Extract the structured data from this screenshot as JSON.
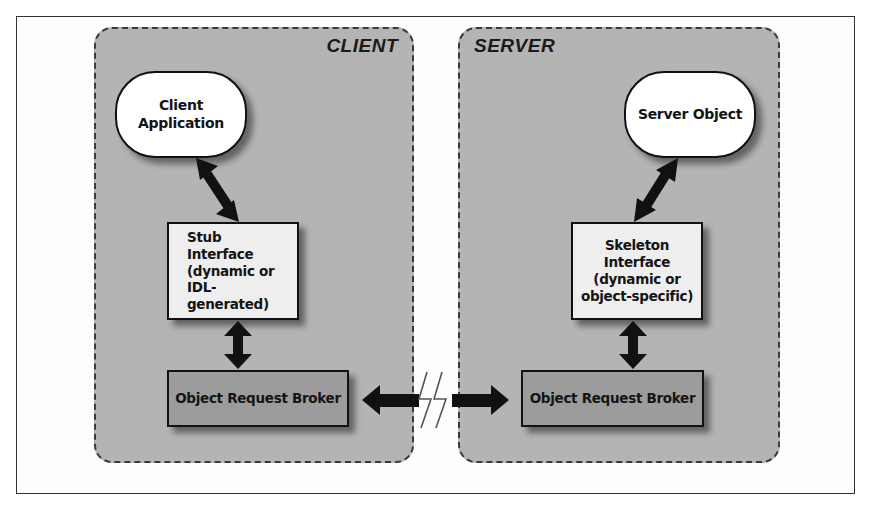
{
  "diagram": {
    "type": "client-server architecture (CORBA ORB)",
    "panels": {
      "client": {
        "title": "CLIENT",
        "nodes": {
          "application": "Client Application",
          "interface": "Stub Interface\n(dynamic or\nIDL-generated)",
          "broker": "Object Request Broker"
        }
      },
      "server": {
        "title": "SERVER",
        "nodes": {
          "object": "Server Object",
          "interface": "Skeleton Interface\n(dynamic or\nobject-specific)",
          "broker": "Object Request Broker"
        }
      }
    },
    "connections": [
      {
        "from": "Client Application",
        "to": "Stub Interface",
        "type": "bidirectional-arrow"
      },
      {
        "from": "Stub Interface",
        "to": "Object Request Broker (client)",
        "type": "bidirectional-arrow"
      },
      {
        "from": "Object Request Broker (client)",
        "to": "Object Request Broker (server)",
        "type": "network-link-arrows",
        "symbol": "lightning-bolt"
      },
      {
        "from": "Server Object",
        "to": "Skeleton Interface",
        "type": "bidirectional-arrow"
      },
      {
        "from": "Skeleton Interface",
        "to": "Object Request Broker (server)",
        "type": "bidirectional-arrow"
      }
    ],
    "colors": {
      "panel_fill": "#b4b4b4",
      "pill_fill": "#ffffff",
      "interface_fill": "#eeeeee",
      "broker_fill": "#9c9c9c",
      "stroke": "#111111"
    }
  }
}
